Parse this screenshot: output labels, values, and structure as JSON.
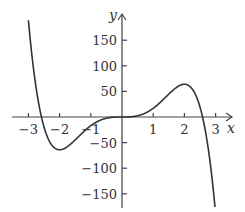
{
  "chart_data": {
    "type": "line",
    "title": "",
    "xlabel": "x",
    "ylabel": "y",
    "xlim": [
      -3.3,
      3.5
    ],
    "ylim": [
      -180,
      200
    ],
    "grid": false,
    "legend": null,
    "x_ticks": [
      -3,
      -2,
      -1,
      1,
      2,
      3
    ],
    "x_tick_labels": [
      "−3",
      "−2",
      "−1",
      "1",
      "2",
      "3"
    ],
    "y_ticks": [
      150,
      100,
      50,
      -50,
      -100,
      -150
    ],
    "y_tick_labels": [
      "150",
      "100",
      "50",
      "−50",
      "−100",
      "−150"
    ],
    "function": "y = 20x^3 - 3x^5",
    "series": [
      {
        "name": "curve",
        "x": [
          -2.9,
          -2.8,
          -2.7,
          -2.582,
          -2.5,
          -2.4,
          -2.2,
          -2.0,
          -1.8,
          -1.5,
          -1.0,
          -0.5,
          0,
          0.5,
          1.0,
          1.5,
          1.8,
          2.0,
          2.2,
          2.4,
          2.5,
          2.582,
          2.7,
          2.8,
          2.9
        ],
        "y": [
          124.3,
          64.2,
          27.6,
          0,
          -16.6,
          -34.5,
          -59.3,
          -64,
          -60.4,
          -44.7,
          -17,
          -2.4,
          0,
          2.4,
          17,
          44.7,
          60.4,
          64,
          59.3,
          34.5,
          16.6,
          0,
          -27.6,
          -64.2,
          -124.3
        ]
      }
    ],
    "color": "#333333"
  }
}
